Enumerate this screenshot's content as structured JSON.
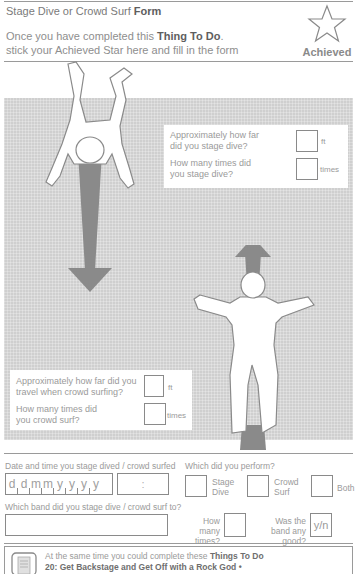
{
  "header": {
    "title_plain": "Stage Dive or Crowd Surf ",
    "title_bold": "Form",
    "intro_line1_plain": "Once you have completed this ",
    "intro_line1_bold": "Thing To Do",
    "intro_line1_end": ".",
    "intro_line2": "stick your Achieved Star here and fill in the form",
    "star_icon": "star-outline-icon",
    "star_label": "Achieved"
  },
  "stage_dive_panel": {
    "q1": "Approximately how far did you stage dive?",
    "q1_unit": "ft",
    "q1_value": "",
    "q2": "How many times did you stage dive?",
    "q2_unit": "times",
    "q2_value": ""
  },
  "crowd_surf_panel": {
    "q1": "Approximately how far did you travel when crowd surfing?",
    "q1_unit": "ft",
    "q1_value": "",
    "q2": "How many times did you crowd surf?",
    "q2_unit": "times",
    "q2_value": ""
  },
  "form": {
    "date_label": "Date and time you stage dived / crowd surfed",
    "date_cells": [
      "d",
      "d",
      "m",
      "m",
      "y",
      "y",
      "y",
      "y"
    ],
    "time_separator": ":",
    "perform_label": "Which did you perform?",
    "perform_options": [
      "Stage Dive",
      "Crowd Surf",
      "Both"
    ],
    "band_label": "Which band did you stage dive / crowd surf to?",
    "band_value": "",
    "how_many_label": "How many times?",
    "good_label": "Was the band any good?",
    "good_placeholder": "y/n"
  },
  "footer": {
    "icon": "document-icon",
    "line1_plain": "At the same time you could complete these ",
    "line1_bold": "Things To Do",
    "line2_bold": "20: Get Backstage and Get Off with a Rock God •"
  }
}
